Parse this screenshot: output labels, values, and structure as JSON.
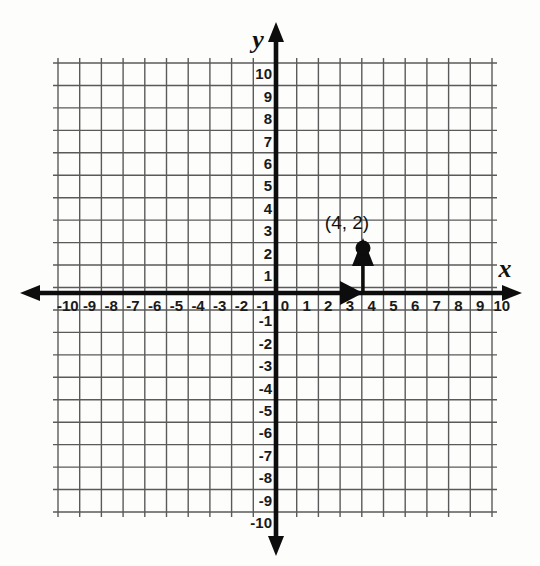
{
  "figure": {
    "background_color": "#fdfdfc",
    "grid_color": "#5a5a5a",
    "axis_color": "#0d0d0d"
  },
  "axes": {
    "x_axis_name": "x",
    "y_axis_name": "y",
    "x_tick_labels": [
      "-10",
      "-9",
      "-8",
      "-7",
      "-6",
      "-5",
      "-4",
      "-3",
      "-2",
      "-1",
      "0",
      "1",
      "2",
      "3",
      "4",
      "5",
      "6",
      "7",
      "8",
      "9",
      "10"
    ],
    "y_tick_labels": [
      "10",
      "9",
      "8",
      "7",
      "6",
      "5",
      "4",
      "3",
      "2",
      "1",
      "0",
      "-1",
      "-2",
      "-3",
      "-4",
      "-5",
      "-6",
      "-7",
      "-8",
      "-9",
      "-10"
    ],
    "x_range": [
      -10,
      10
    ],
    "y_range": [
      -10,
      10
    ],
    "origin_label": "0",
    "grid_step": 1
  },
  "chart_data": {
    "type": "scatter",
    "title": "",
    "xlabel": "x",
    "ylabel": "y",
    "xlim": [
      -10,
      10
    ],
    "ylim": [
      -10,
      10
    ],
    "grid": true,
    "legend": "none",
    "points": [
      {
        "label": "(4, 2)",
        "x": 4,
        "y": 2,
        "marker": "filled-circle",
        "color": "#0d0d0d"
      }
    ],
    "annotations": [
      {
        "name": "horizontal-travel-arrow",
        "description": "arrow along x-axis from origin to x = 4",
        "from": [
          0,
          0
        ],
        "to": [
          4,
          0
        ]
      },
      {
        "name": "vertical-travel-arrow",
        "description": "arrow from x-axis up to the point (4, 2)",
        "from": [
          4,
          0
        ],
        "to": [
          4,
          2
        ]
      }
    ],
    "x": [
      4
    ],
    "values": [
      2
    ],
    "categories": [
      "(4, 2)"
    ]
  }
}
